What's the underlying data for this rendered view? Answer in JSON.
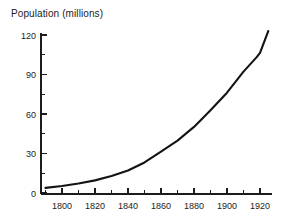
{
  "chart_data": {
    "type": "line",
    "title": "Population (millions)",
    "xlabel": "",
    "ylabel": "Population (millions)",
    "xlim": [
      1788,
      1928
    ],
    "ylim": [
      0,
      128
    ],
    "grid": false,
    "legend": "none",
    "x_ticks_major": [
      1800,
      1820,
      1840,
      1860,
      1880,
      1900,
      1920
    ],
    "x_tick_labels": [
      "1800",
      "1820",
      "1840",
      "1860",
      "1880",
      "1900",
      "1920"
    ],
    "x_ticks_minor": [
      1790,
      1810,
      1830,
      1850,
      1870,
      1890,
      1910
    ],
    "y_ticks_major": [
      0,
      30,
      60,
      90,
      120
    ],
    "y_tick_labels": [
      "0",
      "30",
      "60",
      "90",
      "120"
    ],
    "y_ticks_minor": [
      15,
      45,
      75,
      105
    ],
    "series": [
      {
        "name": "Population",
        "color": "#141414",
        "x": [
          1790,
          1800,
          1810,
          1820,
          1830,
          1840,
          1850,
          1860,
          1870,
          1880,
          1890,
          1900,
          1910,
          1918,
          1920,
          1925
        ],
        "values": [
          3.9,
          5.3,
          7.2,
          9.6,
          12.9,
          17.1,
          23.2,
          31.4,
          39.8,
          50.2,
          62.9,
          76.2,
          92.2,
          103.2,
          106.5,
          123.0
        ]
      }
    ]
  },
  "axis_labels": {
    "y": [
      "120",
      "90",
      "60",
      "30",
      "0"
    ],
    "x": [
      "1800",
      "1820",
      "1840",
      "1860",
      "1880",
      "1900",
      "1920"
    ]
  }
}
